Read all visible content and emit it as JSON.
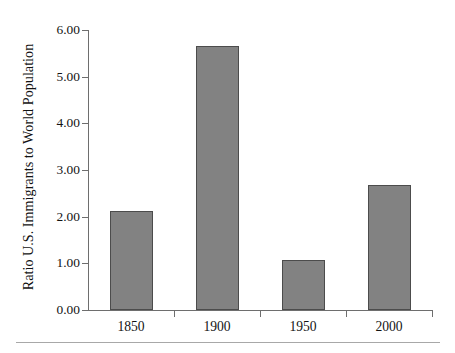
{
  "chart_data": {
    "type": "bar",
    "title": "",
    "subtitle": "",
    "xlabel": "",
    "ylabel": "Ratio U.S. Immigrants to World Population",
    "categories": [
      "1850",
      "1900",
      "1950",
      "2000"
    ],
    "values": [
      2.13,
      5.65,
      1.07,
      2.67
    ],
    "series": [
      {
        "name": "Ratio U.S. Immigrants to World Population",
        "values": [
          2.13,
          5.65,
          1.07,
          2.67
        ]
      }
    ],
    "ylim": [
      0.0,
      6.0
    ],
    "ytick_labels": [
      "0.00",
      "1.00",
      "2.00",
      "3.00",
      "4.00",
      "5.00",
      "6.00"
    ],
    "ytick_values": [
      0.0,
      1.0,
      2.0,
      3.0,
      4.0,
      5.0,
      6.0
    ],
    "xtick_labels": [
      "1850",
      "1900",
      "1950",
      "2000"
    ],
    "grid": false,
    "legend": false,
    "legend_position": "none",
    "annotations": []
  },
  "style": {
    "bar_fill": "#828282",
    "bar_stroke": "#4c4c4c",
    "axis_color": "#6e6e6e",
    "text_color": "#131313",
    "background": "#ffffff",
    "rule_color": "#a8a8a8"
  }
}
